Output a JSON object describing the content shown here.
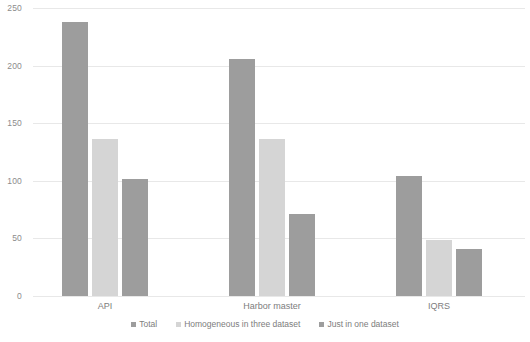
{
  "chart_data": {
    "type": "bar",
    "title": "",
    "subtitle": "",
    "xlabel": "",
    "ylabel": "",
    "categories": [
      "API",
      "Harbor master",
      "IQRS"
    ],
    "series": [
      {
        "name": "Total",
        "values": [
          238,
          206,
          104
        ],
        "color": "#9d9d9d"
      },
      {
        "name": "Homogeneous in three dataset",
        "values": [
          136,
          136,
          49
        ],
        "color": "#d5d5d5"
      },
      {
        "name": "Just in one dataset",
        "values": [
          102,
          71,
          41
        ],
        "color": "#9d9d9d"
      }
    ],
    "ylim": [
      0,
      250
    ],
    "yticks": [
      0,
      50,
      100,
      150,
      200,
      250
    ],
    "ytick_labels": [
      "0",
      "50",
      "100",
      "150",
      "200",
      "250"
    ],
    "grid": true,
    "grid_axis": "y",
    "grid_color": "#e8e8e8",
    "legend_position": "bottom",
    "background_color": "#ffffff",
    "tick_label_color": "#8c8c8c",
    "category_label_color": "#7d7d7d"
  },
  "axis": {
    "yticks": [
      {
        "label": "250",
        "value": 250
      },
      {
        "label": "200",
        "value": 200
      },
      {
        "label": "150",
        "value": 150
      },
      {
        "label": "100",
        "value": 100
      },
      {
        "label": "50",
        "value": 50
      },
      {
        "label": "0",
        "value": 0
      }
    ],
    "categories": [
      {
        "label": "API"
      },
      {
        "label": "Harbor master"
      },
      {
        "label": "IQRS"
      }
    ]
  },
  "legend": {
    "items": [
      {
        "label": "Total",
        "color": "#9d9d9d"
      },
      {
        "label": "Homogeneous in three dataset",
        "color": "#d5d5d5"
      },
      {
        "label": "Just in one dataset",
        "color": "#9d9d9d"
      }
    ]
  }
}
